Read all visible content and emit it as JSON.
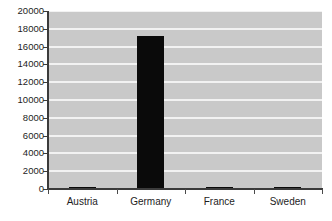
{
  "chart_data": {
    "type": "bar",
    "title": "",
    "subtitle": "",
    "xlabel": "",
    "ylabel": "",
    "categories": [
      "Austria",
      "Germany",
      "France",
      "Sweden"
    ],
    "values": [
      250,
      17200,
      180,
      260
    ],
    "series": [
      {
        "name": "",
        "values": [
          250,
          17200,
          180,
          260
        ]
      }
    ],
    "ylim": [
      0,
      20000
    ],
    "ytick_step": 2000,
    "ytick_labels": [
      "0",
      "2000",
      "4000",
      "6000",
      "8000",
      "10000",
      "12000",
      "14000",
      "16000",
      "18000",
      "20000"
    ],
    "grid": true,
    "grid_axis": "y",
    "legend": false,
    "legend_position": "none",
    "bar_color": "#0a0a0a",
    "plot_background_color": "#c9c9c9",
    "gridline_color": "#f2f2f2",
    "axis_color": "#3b3b3b",
    "page_background_color": "#ffffff",
    "annotations": []
  },
  "figure": {
    "cropped_title_text": ""
  }
}
